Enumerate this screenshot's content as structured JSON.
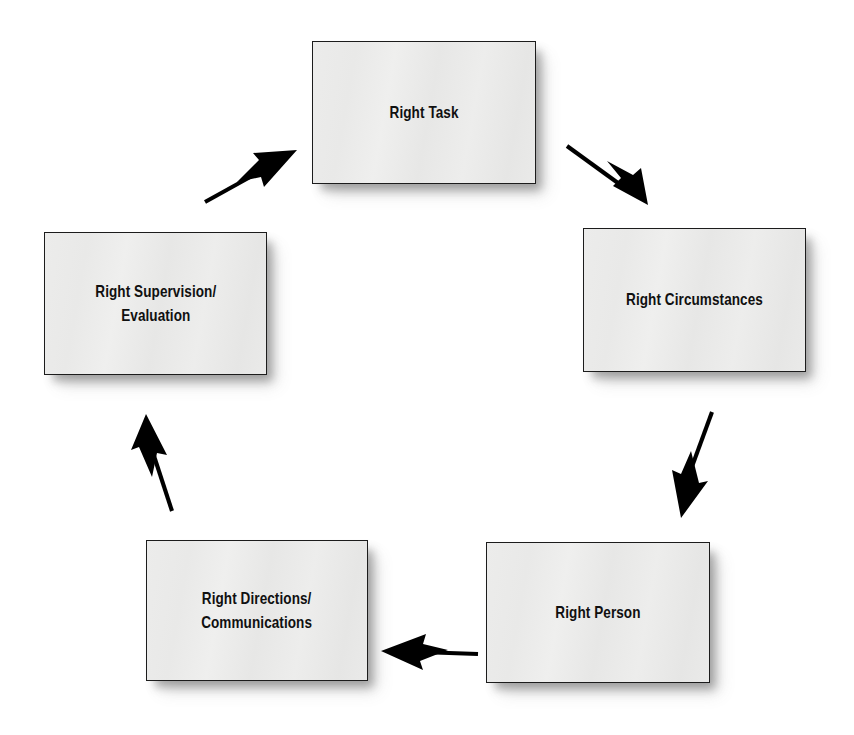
{
  "diagram": {
    "type": "cycle",
    "direction": "clockwise",
    "background_color": "#ffffff",
    "node_fill_color": "#e9e9e8",
    "node_border_color": "#1c1c1c",
    "text_color": "#101010",
    "arrow_color": "#000000",
    "nodes": [
      {
        "id": "right-task",
        "label": "Right Task",
        "position": "top"
      },
      {
        "id": "right-circumstances",
        "label": "Right Circumstances",
        "position": "right"
      },
      {
        "id": "right-person",
        "label": "Right Person",
        "position": "bottom-right"
      },
      {
        "id": "right-directions",
        "label": "Right Directions/\nCommunications",
        "position": "bottom-left"
      },
      {
        "id": "right-supervision",
        "label": "Right Supervision/\nEvaluation",
        "position": "left"
      }
    ],
    "arrows": [
      {
        "id": "task-to-circumstances",
        "from": "right-task",
        "to": "right-circumstances",
        "style": "barbed-arrowhead"
      },
      {
        "id": "circumstances-to-person",
        "from": "right-circumstances",
        "to": "right-person",
        "style": "barbed-arrowhead"
      },
      {
        "id": "person-to-directions",
        "from": "right-person",
        "to": "right-directions",
        "style": "barbed-arrowhead"
      },
      {
        "id": "directions-to-supervision",
        "from": "right-directions",
        "to": "right-supervision",
        "style": "barbed-arrowhead"
      },
      {
        "id": "supervision-to-task",
        "from": "right-supervision",
        "to": "right-task",
        "style": "barbed-arrowhead"
      }
    ]
  }
}
